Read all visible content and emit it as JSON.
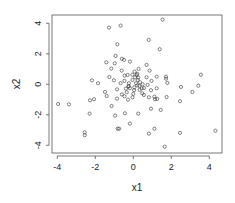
{
  "chart_data": {
    "type": "scatter",
    "title": "",
    "xlabel": "x1",
    "ylabel": "x2",
    "xlim": [
      -4.2,
      4.6
    ],
    "ylim": [
      -4.3,
      4.6
    ],
    "xticks": [
      -4,
      -2,
      0,
      2,
      4
    ],
    "yticks": [
      -4,
      -2,
      0,
      2,
      4
    ],
    "xtick_labels": [
      "-4",
      "-2",
      "0",
      "2",
      "4"
    ],
    "ytick_labels": [
      "-4",
      "-2",
      "0",
      "2",
      "4"
    ],
    "grid": false,
    "legend": null,
    "marker": "open-circle",
    "marker_color": "#333333",
    "series": [
      {
        "name": "x2 vs x1",
        "points": [
          [
            1.54,
            4.24
          ],
          [
            -1.28,
            3.72
          ],
          [
            -0.67,
            3.85
          ],
          [
            0.81,
            2.91
          ],
          [
            -0.84,
            2.62
          ],
          [
            1.39,
            2.3
          ],
          [
            -0.93,
            1.86
          ],
          [
            -0.6,
            1.68
          ],
          [
            -0.49,
            1.6
          ],
          [
            -1.42,
            1.44
          ],
          [
            -0.98,
            1.38
          ],
          [
            -0.18,
            1.49
          ],
          [
            0.7,
            1.27
          ],
          [
            -1.16,
            1.03
          ],
          [
            -0.61,
            0.9
          ],
          [
            0.28,
            1.01
          ],
          [
            0.86,
            0.9
          ],
          [
            0.07,
            0.83
          ],
          [
            -1.26,
            0.48
          ],
          [
            -1.02,
            0.26
          ],
          [
            -0.3,
            0.61
          ],
          [
            -0.05,
            0.63
          ],
          [
            0.18,
            0.61
          ],
          [
            -0.46,
            0.57
          ],
          [
            -2.18,
            0.26
          ],
          [
            -1.86,
            0.07
          ],
          [
            0.7,
            0.46
          ],
          [
            1.23,
            0.5
          ],
          [
            1.72,
            0.5
          ],
          [
            1.72,
            0.37
          ],
          [
            3.56,
            0.63
          ],
          [
            -0.23,
            0.07
          ],
          [
            -0.04,
            0.28
          ],
          [
            0.23,
            0.28
          ],
          [
            0.35,
            0.13
          ],
          [
            0.96,
            0.22
          ],
          [
            1.79,
            0.09
          ],
          [
            0.21,
            -0.07
          ],
          [
            -0.25,
            -0.11
          ],
          [
            0.56,
            -0.24
          ],
          [
            -0.86,
            -0.33
          ],
          [
            -0.39,
            -0.28
          ],
          [
            1.23,
            -0.26
          ],
          [
            2.51,
            -0.17
          ],
          [
            3.42,
            -0.09
          ],
          [
            -1.49,
            -0.5
          ],
          [
            0.04,
            -0.39
          ],
          [
            0.93,
            -0.39
          ],
          [
            3.11,
            -0.5
          ],
          [
            -1.4,
            -0.77
          ],
          [
            -0.6,
            -0.66
          ],
          [
            -0.47,
            -0.79
          ],
          [
            -0.04,
            -0.85
          ],
          [
            0.56,
            -0.7
          ],
          [
            1.11,
            -0.81
          ],
          [
            1.75,
            -0.83
          ],
          [
            -2.28,
            -1.05
          ],
          [
            -2.07,
            -0.98
          ],
          [
            -0.86,
            -0.94
          ],
          [
            -0.28,
            -1.01
          ],
          [
            0.82,
            -0.85
          ],
          [
            1.14,
            -0.98
          ],
          [
            1.26,
            -0.96
          ],
          [
            2.46,
            -1.11
          ],
          [
            -3.96,
            -1.29
          ],
          [
            -3.39,
            -1.31
          ],
          [
            -1.14,
            -1.42
          ],
          [
            0.93,
            -1.6
          ],
          [
            1.44,
            -1.68
          ],
          [
            -2.3,
            -1.92
          ],
          [
            -0.96,
            -2.05
          ],
          [
            -0.44,
            -1.9
          ],
          [
            0.26,
            -1.92
          ],
          [
            -0.18,
            -2.58
          ],
          [
            -0.82,
            -2.91
          ],
          [
            -0.75,
            -2.91
          ],
          [
            1.11,
            -2.91
          ],
          [
            4.32,
            -3.04
          ],
          [
            -2.56,
            -3.15
          ],
          [
            -2.56,
            -3.34
          ],
          [
            0.82,
            -3.23
          ],
          [
            2.46,
            -3.19
          ],
          [
            1.65,
            -4.09
          ],
          [
            -0.26,
            -0.15
          ],
          [
            -0.18,
            -0.26
          ],
          [
            0.05,
            -0.2
          ],
          [
            0.14,
            0.07
          ],
          [
            0.32,
            -0.11
          ],
          [
            0.44,
            -0.26
          ],
          [
            0.49,
            0.0
          ],
          [
            0.09,
            0.46
          ],
          [
            0.26,
            0.44
          ],
          [
            -0.67,
            0.07
          ],
          [
            0.0,
            -0.63
          ],
          [
            0.47,
            -0.59
          ],
          [
            0.21,
            0.68
          ],
          [
            -0.35,
            -0.52
          ],
          [
            0.75,
            -0.04
          ],
          [
            -0.47,
            0.22
          ],
          [
            0.33,
            -0.37
          ]
        ]
      }
    ]
  }
}
